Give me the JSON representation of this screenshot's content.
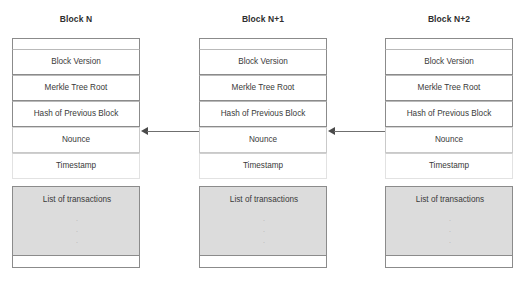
{
  "diagram": {
    "blocks": [
      {
        "title": "Block N",
        "fields": [
          {
            "label": "Block Version"
          },
          {
            "label": "Merkle Tree Root"
          },
          {
            "label": "Hash of Previous Block"
          },
          {
            "label": "Nounce"
          },
          {
            "label": "Timestamp"
          }
        ],
        "transactions": {
          "label": "List of transactions",
          "dots": [
            ".",
            ".",
            "."
          ]
        }
      },
      {
        "title": "Block N+1",
        "fields": [
          {
            "label": "Block Version"
          },
          {
            "label": "Merkle Tree Root"
          },
          {
            "label": "Hash of Previous Block"
          },
          {
            "label": "Nounce"
          },
          {
            "label": "Timestamp"
          }
        ],
        "transactions": {
          "label": "List of transactions",
          "dots": [
            ".",
            ".",
            "."
          ]
        }
      },
      {
        "title": "Block N+2",
        "fields": [
          {
            "label": "Block Version"
          },
          {
            "label": "Merkle Tree Root"
          },
          {
            "label": "Hash of Previous Block"
          },
          {
            "label": "Nounce"
          },
          {
            "label": "Timestamp"
          }
        ],
        "transactions": {
          "label": "List of transactions",
          "dots": [
            ".",
            ".",
            "."
          ]
        }
      }
    ],
    "arrows": [
      {
        "name": "arrow-block-n1-to-n",
        "direction": "left"
      },
      {
        "name": "arrow-block-n2-to-n1",
        "direction": "left"
      }
    ],
    "colors": {
      "border": "#8b8b8b",
      "transaction_fill": "#dcdcdc",
      "text": "#3a3a3a",
      "arrow": "#4a4a4a",
      "background": "#ffffff"
    }
  }
}
